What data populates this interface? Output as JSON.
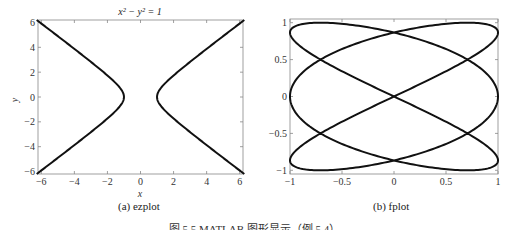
{
  "figure_caption": "图 5.5  MATLAB 图形显示（例 5.4）",
  "chart_data": [
    {
      "type": "line",
      "panel": "left",
      "subcaption": "(a) ezplot",
      "title": "x² − y² = 1",
      "xlabel": "x",
      "ylabel": "y",
      "xlim": [
        -6.2,
        6.2
      ],
      "ylim": [
        -6.2,
        6.2
      ],
      "xticks": [
        -6,
        -4,
        -2,
        0,
        2,
        4,
        6
      ],
      "yticks": [
        -6,
        -4,
        -2,
        0,
        2,
        4,
        6
      ],
      "xtick_labels": [
        "−6",
        "−4",
        "−2",
        "0",
        "2",
        "4",
        "6"
      ],
      "ytick_labels": [
        "−6",
        "−4",
        "−2",
        "0",
        "2",
        "4",
        "6"
      ],
      "grid": false,
      "series": [
        {
          "name": "x^2 - y^2 = 1 (left branch)",
          "equation": "x = -sqrt(1 + y^2)",
          "t_range": [
            -6.2,
            6.2
          ]
        },
        {
          "name": "x^2 - y^2 = 1 (right branch)",
          "equation": "x = sqrt(1 + y^2)",
          "t_range": [
            -6.2,
            6.2
          ]
        }
      ],
      "line_color": "#111111"
    },
    {
      "type": "line",
      "panel": "right",
      "subcaption": "(b) fplot",
      "title": "",
      "xlabel": "",
      "ylabel": "",
      "xlim": [
        -1,
        1
      ],
      "ylim": [
        -1.05,
        1.05
      ],
      "xticks": [
        -1,
        -0.5,
        0,
        0.5,
        1
      ],
      "yticks": [
        -1,
        -0.5,
        0,
        0.5,
        1
      ],
      "xtick_labels": [
        "−1",
        "−0.5",
        "0",
        "0.5",
        "1"
      ],
      "ytick_labels": [
        "−1",
        "−0.5",
        "0",
        "0.5",
        "1"
      ],
      "grid": false,
      "series": [
        {
          "name": "parametric curve",
          "x": "cos(3t)",
          "y": "sin(2t)",
          "t_range": [
            0,
            6.2832
          ]
        }
      ],
      "line_color": "#111111"
    }
  ]
}
